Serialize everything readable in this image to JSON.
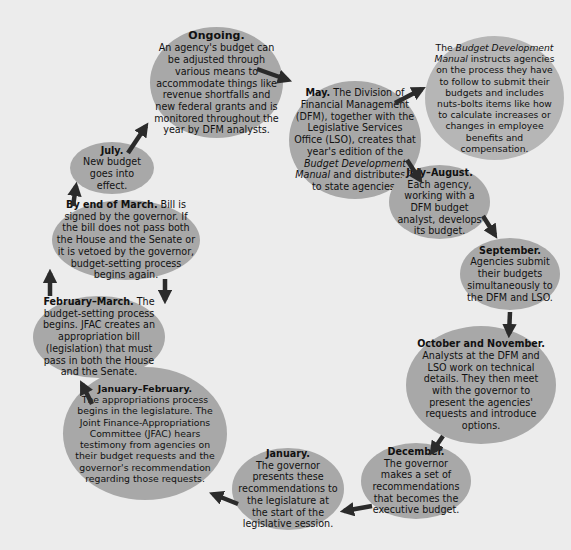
{
  "diagram": {
    "type": "budget-cycle",
    "colors": {
      "background": "#ececec",
      "node_fill": "#a8a8a8",
      "node_fill_light": "#b6b6b6",
      "arrow": "#2b2b2b",
      "text": "#111111"
    },
    "nodes": {
      "ongoing": {
        "title": "Ongoing.",
        "text": "An agency's budget can be adjusted through various means to accommodate things like revenue shortfalls and new federal grants and is monitored throughout the year by DFM analysts."
      },
      "may": {
        "title": "May.",
        "text_a": " The Division of Financial Management (DFM), together with the Legislative Services Office (LSO), creates that year's edition of the ",
        "text_italic": "Budget Development Manual",
        "text_b": " and distributes it to state agencies."
      },
      "manual_note": {
        "text_a": "The ",
        "text_italic": "Budget Development Manual",
        "text_b": " instructs agencies on the process they have to follow to submit their budgets and includes nuts-bolts items like how to calculate increases or changes in employee benefits and compensation."
      },
      "july_august": {
        "title": "July–August.",
        "text": "Each agency, working with a DFM budget analyst, develops its budget."
      },
      "september": {
        "title": "September.",
        "text": "Agencies submit their budgets simultaneously to the DFM and LSO."
      },
      "october_november": {
        "title": "October and November.",
        "text": " Analysts at the DFM and LSO work on technical details. They then meet with the governor to present the agencies' requests and introduce options."
      },
      "december": {
        "title": "December.",
        "text": "The governor makes a set of recommendations that becomes the executive budget."
      },
      "january": {
        "title": "January.",
        "text": "The governor presents these recommendations to the legislature at the start of the legislative session."
      },
      "january_february": {
        "title": "January–February.",
        "text": "The appropriations process begins in the legislature. The Joint Finance-Appropriations Committee (JFAC) hears testimony from agencies on their budget requests and the governor's recommendation regarding those requests."
      },
      "february_march": {
        "title": "February–March.",
        "text": " The budget-setting process begins. JFAC creates an appropriation bill (legislation) that must pass in both the House and the Senate."
      },
      "end_of_march": {
        "title": "By end of March.",
        "text": " Bill is signed by the governor. If the bill does not pass both the House and the Senate or it is vetoed by the governor, budget-setting process begins again."
      },
      "july": {
        "title": "July.",
        "text": "New budget goes into effect."
      }
    },
    "arrows": [
      {
        "from": "ongoing",
        "to": "may"
      },
      {
        "from": "may",
        "to": "manual_note"
      },
      {
        "from": "may",
        "to": "july_august"
      },
      {
        "from": "july_august",
        "to": "september"
      },
      {
        "from": "september",
        "to": "october_november"
      },
      {
        "from": "october_november",
        "to": "december"
      },
      {
        "from": "december",
        "to": "january"
      },
      {
        "from": "january",
        "to": "january_february"
      },
      {
        "from": "january_february",
        "to": "february_march"
      },
      {
        "from": "february_march",
        "to": "end_of_march"
      },
      {
        "from": "end_of_march",
        "to": "february_march"
      },
      {
        "from": "end_of_march",
        "to": "july"
      },
      {
        "from": "july",
        "to": "ongoing"
      }
    ]
  }
}
